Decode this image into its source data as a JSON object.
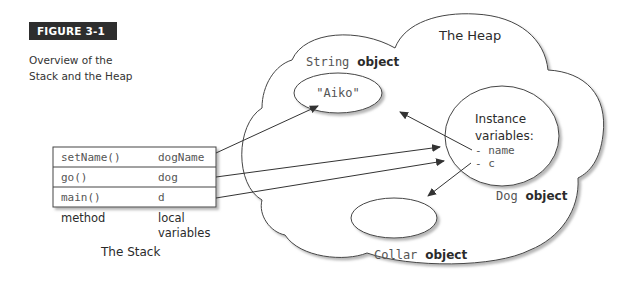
{
  "figure": {
    "label": "FIGURE 3-1",
    "caption": "Overview of the Stack and the Heap"
  },
  "stack": {
    "title": "The Stack",
    "rows": [
      {
        "method": "setName()",
        "local": "dogName"
      },
      {
        "method": "go()",
        "local": "dog"
      },
      {
        "method": "main()",
        "local": "d"
      }
    ],
    "col_label_method": "method",
    "col_label_local_1": "local",
    "col_label_local_2": "variables"
  },
  "heap": {
    "title": "The Heap",
    "string_object": {
      "type": "String",
      "suffix": "object",
      "value": "\"Aiko\""
    },
    "dog_object": {
      "type": "Dog",
      "suffix": "object",
      "heading_1": "Instance",
      "heading_2": "variables:",
      "fields": [
        "- name",
        "- c"
      ]
    },
    "collar_object": {
      "type": "Collar",
      "suffix": "object"
    }
  },
  "references": [
    {
      "from": "setName().dogName",
      "to": "String object"
    },
    {
      "from": "go().dog",
      "to": "Dog object"
    },
    {
      "from": "main().d",
      "to": "Dog object"
    },
    {
      "from": "Dog.name",
      "to": "String object"
    },
    {
      "from": "Dog.c",
      "to": "Collar object"
    }
  ]
}
